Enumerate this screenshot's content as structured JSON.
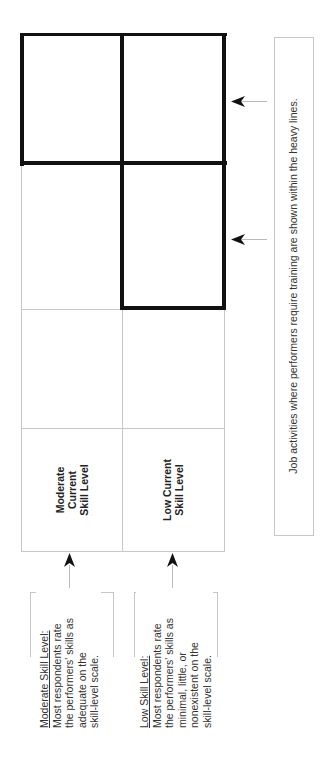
{
  "figure": {
    "orientation": "rotated -90deg",
    "row_labels": [
      {
        "id": "moderate",
        "lines": [
          "Moderate",
          "Current",
          "Skill Level"
        ]
      },
      {
        "id": "low",
        "lines": [
          "Low Current",
          "Skill Level"
        ]
      }
    ],
    "notes": [
      {
        "id": "moderate",
        "title": "Moderate Skill Level:",
        "lines": [
          "Most respondents rate",
          "the performers' skills as",
          "adequate on the",
          "skill-level scale."
        ]
      },
      {
        "id": "low",
        "title": "Low Skill Level:",
        "lines": [
          "Most respondents rate",
          "the performers' skills as",
          "minimal, little, or",
          "nonexistent on the",
          "skill-level scale."
        ]
      }
    ],
    "footnote": "Job activities where performers require training are shown within the heavy lines.",
    "colors": {
      "heavy_line": "#111111",
      "thin_line": "#c8c8c8",
      "text": "#333333",
      "background": "#ffffff"
    }
  }
}
